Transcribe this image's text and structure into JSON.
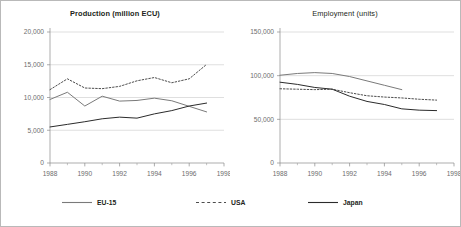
{
  "chart_data": [
    {
      "type": "line",
      "title": "Production (million ECU)",
      "xlabel": "",
      "ylabel": "",
      "x": [
        1988,
        1989,
        1990,
        1991,
        1992,
        1993,
        1994,
        1995,
        1996,
        1997
      ],
      "xlim": [
        1988,
        1998
      ],
      "ylim": [
        0,
        20000
      ],
      "yticks": [
        0,
        5000,
        10000,
        15000,
        20000
      ],
      "ytick_labels": [
        "0",
        "5,000",
        "10,000",
        "15,000",
        "20,000"
      ],
      "xticks": [
        1988,
        1990,
        1992,
        1994,
        1996,
        1998
      ],
      "xtick_labels": [
        "1988",
        "1990",
        "1992",
        "1994",
        "1996",
        "1998"
      ],
      "xminor_ticks": [
        1989,
        1991,
        1993,
        1995,
        1997
      ],
      "grid": "horizontal",
      "legend_position": "below-figure",
      "series": [
        {
          "name": "EU-15",
          "style": "solid",
          "color": "#7a7a7a",
          "values": [
            9700,
            10800,
            8700,
            10200,
            9450,
            9550,
            9900,
            9500,
            8650,
            7800
          ]
        },
        {
          "name": "USA",
          "style": "dotted",
          "color": "#4d4d4d",
          "values": [
            11200,
            12850,
            11450,
            11350,
            11700,
            12550,
            13050,
            12250,
            12850,
            15050
          ]
        },
        {
          "name": "Japan",
          "style": "solid",
          "color": "#2b2b2b",
          "values": [
            5500,
            5900,
            6300,
            6750,
            7000,
            6850,
            7500,
            8000,
            8700,
            9150
          ]
        }
      ]
    },
    {
      "type": "line",
      "title": "Employment (units)",
      "xlabel": "",
      "ylabel": "",
      "x": [
        1988,
        1989,
        1990,
        1991,
        1992,
        1993,
        1994,
        1995,
        1996,
        1997
      ],
      "xlim": [
        1988,
        1998
      ],
      "ylim": [
        0,
        150000
      ],
      "yticks": [
        0,
        50000,
        100000,
        150000
      ],
      "ytick_labels": [
        "0",
        "50,000",
        "100,000",
        "150,000"
      ],
      "xticks": [
        1988,
        1990,
        1992,
        1994,
        1996,
        1998
      ],
      "xtick_labels": [
        "1988",
        "1990",
        "1992",
        "1994",
        "1996",
        "1998"
      ],
      "xminor_ticks": [
        1989,
        1991,
        1993,
        1995,
        1997
      ],
      "grid": "horizontal",
      "legend_position": "below-figure",
      "series": [
        {
          "name": "EU-15",
          "style": "solid",
          "color": "#7a7a7a",
          "values": [
            100500,
            102500,
            103500,
            102500,
            99000,
            94000,
            89000,
            84000,
            null,
            null
          ]
        },
        {
          "name": "USA",
          "style": "dotted",
          "color": "#4d4d4d",
          "values": [
            85000,
            84500,
            84000,
            84500,
            80500,
            77000,
            75500,
            74500,
            73000,
            72000
          ]
        },
        {
          "name": "Japan",
          "style": "solid",
          "color": "#2b2b2b",
          "values": [
            92500,
            90000,
            86500,
            84500,
            76500,
            70500,
            67000,
            62000,
            60500,
            60000
          ]
        }
      ]
    }
  ],
  "legend": {
    "items": [
      {
        "label": "EU-15",
        "style": "solid",
        "color": "#7a7a7a"
      },
      {
        "label": "USA",
        "style": "dotted",
        "color": "#4d4d4d"
      },
      {
        "label": "Japan",
        "style": "solid",
        "color": "#2b2b2b"
      }
    ]
  }
}
